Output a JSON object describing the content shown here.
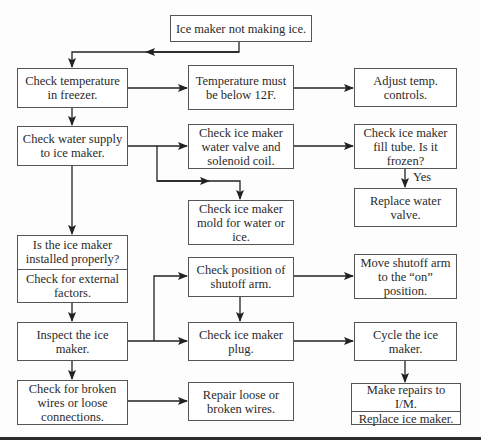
{
  "diagram": {
    "start": {
      "text": "Ice maker not making ice."
    },
    "left_column": [
      {
        "id": "check-temp",
        "text": "Check temperature in freezer."
      },
      {
        "id": "check-water-supply",
        "text": "Check water supply to ice maker."
      },
      {
        "id": "installed-properly",
        "parts": [
          "Is the ice maker installed properly?",
          "Check for external factors."
        ]
      },
      {
        "id": "inspect",
        "text": "Inspect the ice maker."
      },
      {
        "id": "check-wires",
        "text": "Check for broken wires or loose connections."
      }
    ],
    "middle_column": [
      {
        "id": "temp-below",
        "text": "Temperature must be below 12F."
      },
      {
        "id": "check-valve",
        "text": "Check ice maker water valve and solenoid coil."
      },
      {
        "id": "check-mold",
        "text": "Check ice maker mold for water or ice."
      },
      {
        "id": "check-shutoff",
        "text": "Check position of shutoff arm."
      },
      {
        "id": "check-plug",
        "text": "Check ice maker plug."
      },
      {
        "id": "repair-wires",
        "text": "Repair loose or broken wires."
      }
    ],
    "right_column": [
      {
        "id": "adjust-temp",
        "text": "Adjust temp. controls."
      },
      {
        "id": "check-fill-tube",
        "text": "Check ice maker fill tube. Is it frozen?"
      },
      {
        "id": "replace-valve",
        "text": "Replace water valve."
      },
      {
        "id": "move-shutoff",
        "text": "Move shutoff arm to the “on” position."
      },
      {
        "id": "cycle",
        "text": "Cycle the ice maker."
      },
      {
        "id": "final",
        "parts": [
          "Make repairs to I/M.",
          "Replace ice maker."
        ]
      }
    ],
    "edge_labels": {
      "yes": "Yes"
    },
    "colors": {
      "line": "#222222",
      "box_border": "#555555",
      "text": "#2a2a2a"
    }
  }
}
